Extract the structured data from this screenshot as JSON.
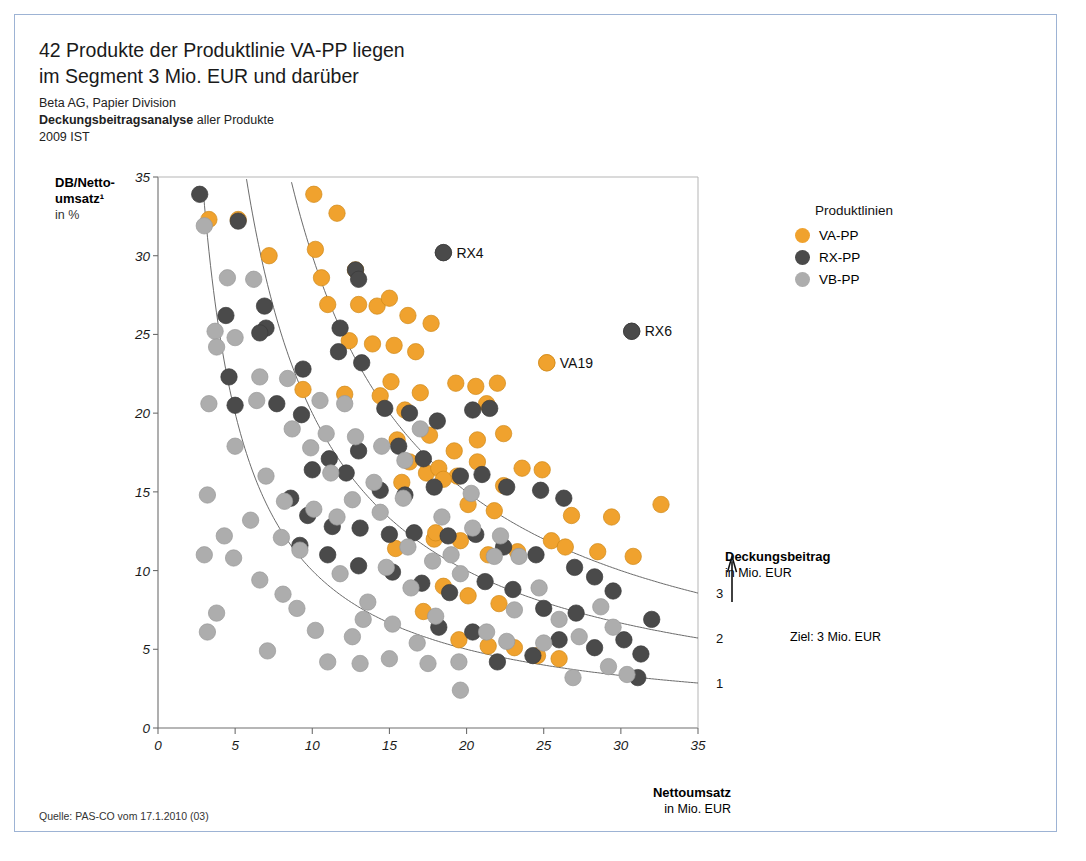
{
  "headline": [
    "42 Produkte der Produktlinie VA-PP liegen",
    "im Segment 3 Mio. EUR und darüber"
  ],
  "subtitle": {
    "line1": "Beta AG, Papier Division",
    "line2_bold": "Deckungsbeitragsanalyse",
    "line2_rest": " aller Produkte",
    "line3": "2009 IST"
  },
  "source": "Quelle: PAS-CO vom 17.1.2010 (03)",
  "legend": {
    "title": "Produktlinien",
    "items": [
      {
        "label": "VA-PP",
        "color": "#F0A22E"
      },
      {
        "label": "RX-PP",
        "color": "#4a4a4a"
      },
      {
        "label": "VB-PP",
        "color": "#adadad"
      }
    ]
  },
  "db_annotation": {
    "title": "Deckungsbeitrag",
    "unit": "in Mio. EUR",
    "curve_labels": [
      "3",
      "2",
      "1"
    ],
    "target_note": "Ziel: 3 Mio. EUR"
  },
  "chart_data": {
    "type": "scatter",
    "title": "Deckungsbeitragsanalyse aller Produkte",
    "xlabel_bold": "Nettoumsatz",
    "xlabel_unit": "in Mio. EUR",
    "ylabel_bold": "DB/Netto-",
    "ylabel_bold2": "umsatz¹",
    "ylabel_unit": "in %",
    "xlim": [
      0,
      35
    ],
    "ylim": [
      0,
      35
    ],
    "xticks": [
      0,
      5,
      10,
      15,
      20,
      25,
      30,
      35
    ],
    "yticks": [
      0,
      5,
      10,
      15,
      20,
      25,
      30,
      35
    ],
    "grid": false,
    "legend_position": "right",
    "reference_curves": {
      "formula": "x * y / 100 = DB",
      "values": [
        1,
        2,
        3
      ],
      "labels": [
        "1",
        "2",
        "3"
      ]
    },
    "annotations": [
      {
        "text": "RX4",
        "x": 18.5,
        "y": 30.2,
        "series": "RX-PP"
      },
      {
        "text": "RX6",
        "x": 30.7,
        "y": 25.2,
        "series": "RX-PP"
      },
      {
        "text": "VA19",
        "x": 25.2,
        "y": 23.2,
        "series": "VA-PP"
      }
    ],
    "series": [
      {
        "name": "VA-PP",
        "color": "#F0A22E",
        "points": [
          [
            3.3,
            32.3
          ],
          [
            5.2,
            32.3
          ],
          [
            7.2,
            30.0
          ],
          [
            10.1,
            33.9
          ],
          [
            10.2,
            30.4
          ],
          [
            11.6,
            32.7
          ],
          [
            10.6,
            28.6
          ],
          [
            12.8,
            29.1
          ],
          [
            13.0,
            26.9
          ],
          [
            14.2,
            26.8
          ],
          [
            15.0,
            27.3
          ],
          [
            13.9,
            24.4
          ],
          [
            15.3,
            24.3
          ],
          [
            16.2,
            26.2
          ],
          [
            17.7,
            25.7
          ],
          [
            9.4,
            21.5
          ],
          [
            12.1,
            21.2
          ],
          [
            14.4,
            21.1
          ],
          [
            15.1,
            22.0
          ],
          [
            16.0,
            20.2
          ],
          [
            17.0,
            21.3
          ],
          [
            19.3,
            21.9
          ],
          [
            22.0,
            21.9
          ],
          [
            20.6,
            21.7
          ],
          [
            21.3,
            20.6
          ],
          [
            15.5,
            18.3
          ],
          [
            17.6,
            18.6
          ],
          [
            19.2,
            17.6
          ],
          [
            20.7,
            18.3
          ],
          [
            22.4,
            18.7
          ],
          [
            16.3,
            16.9
          ],
          [
            17.4,
            16.2
          ],
          [
            18.2,
            16.5
          ],
          [
            19.4,
            16.0
          ],
          [
            20.7,
            16.9
          ],
          [
            22.4,
            15.4
          ],
          [
            23.6,
            16.5
          ],
          [
            24.9,
            16.4
          ],
          [
            15.8,
            15.6
          ],
          [
            18.5,
            15.8
          ],
          [
            20.1,
            14.2
          ],
          [
            21.8,
            13.8
          ],
          [
            26.8,
            13.5
          ],
          [
            29.4,
            13.4
          ],
          [
            32.6,
            14.2
          ],
          [
            17.9,
            12.0
          ],
          [
            19.6,
            11.9
          ],
          [
            21.4,
            11.0
          ],
          [
            23.3,
            11.2
          ],
          [
            25.5,
            11.9
          ],
          [
            26.4,
            11.5
          ],
          [
            28.5,
            11.2
          ],
          [
            30.8,
            10.9
          ],
          [
            15.4,
            11.4
          ],
          [
            18.5,
            9.0
          ],
          [
            20.1,
            8.4
          ],
          [
            22.1,
            7.9
          ],
          [
            17.2,
            7.4
          ],
          [
            19.5,
            5.6
          ],
          [
            21.4,
            5.2
          ],
          [
            24.6,
            4.6
          ],
          [
            25.2,
            23.2
          ],
          [
            11.0,
            26.9
          ],
          [
            12.4,
            24.6
          ],
          [
            16.7,
            23.9
          ],
          [
            18.0,
            12.4
          ],
          [
            23.1,
            5.1
          ],
          [
            26.0,
            4.4
          ]
        ]
      },
      {
        "name": "RX-PP",
        "color": "#4a4a4a",
        "points": [
          [
            2.7,
            33.9
          ],
          [
            5.2,
            32.2
          ],
          [
            4.4,
            26.2
          ],
          [
            6.9,
            26.8
          ],
          [
            7.0,
            25.4
          ],
          [
            6.6,
            25.1
          ],
          [
            9.4,
            22.8
          ],
          [
            4.6,
            22.3
          ],
          [
            7.7,
            20.6
          ],
          [
            5.0,
            20.5
          ],
          [
            9.3,
            19.9
          ],
          [
            12.8,
            29.1
          ],
          [
            13.0,
            28.5
          ],
          [
            11.8,
            25.4
          ],
          [
            11.7,
            23.9
          ],
          [
            13.2,
            23.2
          ],
          [
            14.7,
            20.3
          ],
          [
            16.3,
            20.0
          ],
          [
            18.5,
            30.2
          ],
          [
            20.4,
            20.2
          ],
          [
            21.5,
            20.3
          ],
          [
            18.1,
            19.5
          ],
          [
            15.6,
            17.9
          ],
          [
            17.2,
            17.1
          ],
          [
            13.0,
            17.6
          ],
          [
            11.1,
            17.1
          ],
          [
            10.0,
            16.4
          ],
          [
            12.2,
            16.2
          ],
          [
            14.4,
            15.1
          ],
          [
            16.0,
            14.8
          ],
          [
            17.9,
            15.3
          ],
          [
            19.6,
            16.0
          ],
          [
            21.0,
            16.1
          ],
          [
            22.6,
            15.3
          ],
          [
            24.8,
            15.1
          ],
          [
            26.3,
            14.6
          ],
          [
            8.6,
            14.6
          ],
          [
            9.7,
            13.5
          ],
          [
            11.3,
            12.8
          ],
          [
            13.1,
            12.7
          ],
          [
            15.0,
            12.3
          ],
          [
            16.6,
            12.4
          ],
          [
            18.8,
            12.2
          ],
          [
            20.6,
            12.3
          ],
          [
            22.4,
            11.5
          ],
          [
            24.5,
            11.0
          ],
          [
            27.0,
            10.2
          ],
          [
            28.3,
            9.6
          ],
          [
            29.5,
            8.7
          ],
          [
            30.7,
            25.2
          ],
          [
            21.2,
            9.3
          ],
          [
            23.0,
            8.8
          ],
          [
            25.0,
            7.6
          ],
          [
            27.1,
            7.3
          ],
          [
            18.9,
            8.6
          ],
          [
            17.1,
            9.2
          ],
          [
            15.2,
            9.9
          ],
          [
            13.0,
            10.3
          ],
          [
            11.0,
            11.0
          ],
          [
            9.2,
            11.6
          ],
          [
            26.0,
            5.6
          ],
          [
            28.3,
            5.1
          ],
          [
            30.2,
            5.6
          ],
          [
            31.3,
            4.7
          ],
          [
            32.0,
            6.9
          ],
          [
            31.1,
            3.2
          ],
          [
            22.0,
            4.2
          ],
          [
            24.3,
            4.6
          ],
          [
            20.4,
            6.1
          ],
          [
            18.2,
            6.4
          ]
        ]
      },
      {
        "name": "VB-PP",
        "color": "#adadad",
        "points": [
          [
            3.0,
            31.9
          ],
          [
            4.5,
            28.6
          ],
          [
            6.2,
            28.5
          ],
          [
            3.7,
            25.2
          ],
          [
            3.8,
            24.2
          ],
          [
            5.0,
            24.8
          ],
          [
            3.3,
            20.6
          ],
          [
            6.6,
            22.3
          ],
          [
            6.4,
            20.8
          ],
          [
            8.7,
            19.0
          ],
          [
            5.0,
            17.9
          ],
          [
            3.2,
            14.8
          ],
          [
            4.3,
            12.2
          ],
          [
            3.0,
            11.0
          ],
          [
            4.9,
            10.8
          ],
          [
            3.8,
            7.3
          ],
          [
            3.2,
            6.1
          ],
          [
            6.6,
            9.4
          ],
          [
            7.1,
            4.9
          ],
          [
            8.1,
            8.5
          ],
          [
            9.2,
            11.3
          ],
          [
            8.2,
            14.4
          ],
          [
            9.9,
            17.8
          ],
          [
            10.9,
            18.7
          ],
          [
            11.2,
            16.2
          ],
          [
            12.8,
            18.5
          ],
          [
            10.1,
            13.9
          ],
          [
            11.6,
            13.4
          ],
          [
            9.0,
            7.6
          ],
          [
            10.2,
            6.2
          ],
          [
            12.6,
            5.8
          ],
          [
            13.6,
            8.0
          ],
          [
            14.8,
            10.2
          ],
          [
            14.4,
            13.7
          ],
          [
            16.0,
            17.0
          ],
          [
            17.0,
            19.0
          ],
          [
            15.9,
            14.6
          ],
          [
            14.0,
            15.6
          ],
          [
            12.6,
            14.5
          ],
          [
            11.8,
            9.8
          ],
          [
            13.3,
            6.9
          ],
          [
            15.0,
            4.4
          ],
          [
            16.8,
            5.4
          ],
          [
            18.0,
            7.1
          ],
          [
            19.6,
            9.8
          ],
          [
            19.0,
            11.0
          ],
          [
            20.4,
            12.7
          ],
          [
            22.2,
            12.2
          ],
          [
            21.8,
            10.9
          ],
          [
            23.4,
            10.9
          ],
          [
            24.7,
            8.9
          ],
          [
            23.1,
            7.5
          ],
          [
            21.3,
            6.1
          ],
          [
            19.5,
            4.2
          ],
          [
            17.5,
            4.1
          ],
          [
            15.2,
            6.6
          ],
          [
            13.1,
            4.1
          ],
          [
            11.0,
            4.2
          ],
          [
            19.6,
            2.4
          ],
          [
            26.0,
            6.9
          ],
          [
            27.3,
            5.8
          ],
          [
            28.7,
            7.7
          ],
          [
            29.5,
            6.4
          ],
          [
            26.9,
            3.2
          ],
          [
            29.2,
            3.9
          ],
          [
            30.4,
            3.4
          ],
          [
            25.0,
            5.4
          ],
          [
            22.6,
            5.5
          ],
          [
            16.4,
            8.9
          ],
          [
            17.8,
            10.6
          ],
          [
            20.3,
            14.9
          ],
          [
            18.4,
            13.4
          ],
          [
            16.2,
            11.5
          ],
          [
            14.5,
            17.9
          ],
          [
            12.1,
            20.6
          ],
          [
            10.5,
            20.8
          ],
          [
            8.4,
            22.2
          ],
          [
            7.0,
            16.0
          ],
          [
            8.0,
            12.1
          ],
          [
            6.0,
            13.2
          ]
        ]
      }
    ]
  }
}
